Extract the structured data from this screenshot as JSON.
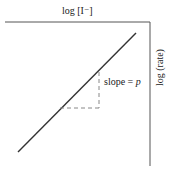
{
  "diagram": {
    "x_axis_label": "log [I⁻]",
    "y_axis_label": "log (rate)",
    "slope_label_prefix": "slope = ",
    "slope_label_var": "p",
    "colors": {
      "line": "#333333",
      "axes": "#555555",
      "dashed": "#888888"
    }
  }
}
